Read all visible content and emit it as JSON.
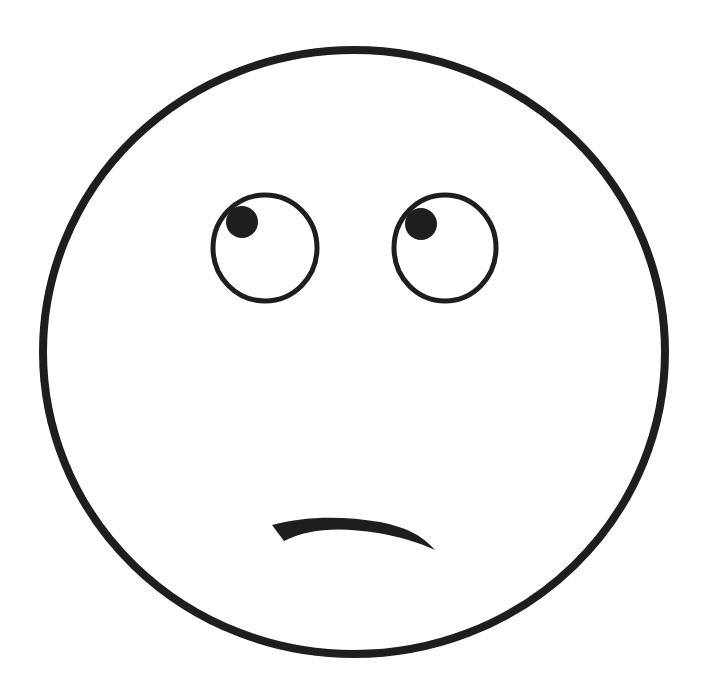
{
  "figure": {
    "subject": "face-eye-roll-drawing",
    "expression": "eye-roll / skeptical",
    "style": "hand-drawn black line art on white",
    "colors": {
      "background": "#ffffff",
      "ink": "#1e1e1e"
    }
  },
  "elements": {
    "face": {
      "cx": 354,
      "cy": 352,
      "rx": 313,
      "ry": 304,
      "stroke_width": 8
    },
    "left_eye": {
      "cx": 265,
      "cy": 248,
      "rx": 52,
      "ry": 53,
      "stroke_width": 5
    },
    "left_pupil": {
      "cx": 242,
      "cy": 222,
      "r": 16
    },
    "right_eye": {
      "cx": 445,
      "cy": 248,
      "rx": 51,
      "ry": 53,
      "stroke_width": 5
    },
    "right_pupil": {
      "cx": 421,
      "cy": 224,
      "r": 16
    },
    "mouth": {
      "shape": "tapered crooked frown",
      "from": [
        273,
        527
      ],
      "to": [
        434,
        550
      ]
    }
  }
}
